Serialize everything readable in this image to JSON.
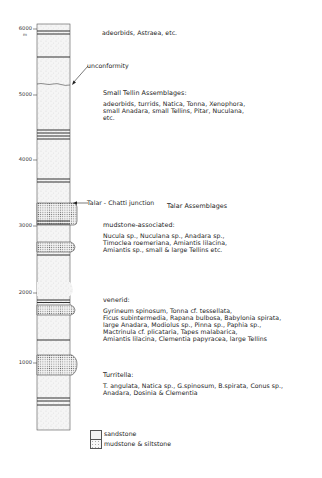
{
  "axis": {
    "ticks": [
      {
        "label": "6000",
        "y": 29
      },
      {
        "label": "5000",
        "y": 95
      },
      {
        "label": "4000",
        "y": 160
      },
      {
        "label": "3000",
        "y": 226
      },
      {
        "label": "2000",
        "y": 293
      },
      {
        "label": "1000",
        "y": 363
      }
    ],
    "unit": "m"
  },
  "annotations": {
    "unconformity": "unconformity",
    "junction": "Talar - Chatti junction"
  },
  "assemblages": {
    "top": {
      "header": "",
      "lines": [
        "adeorbids, Astraea, etc."
      ]
    },
    "small_tellin": {
      "header": "Small Tellin Assemblages:",
      "lines": [
        "adeorbids, turrids, Natica, Tonna, Xenophora,",
        "small Anadara, small Tellins, Pitar, Nuculana,",
        "etc."
      ]
    },
    "talar_title": "Talar Assemblages",
    "mudstone": {
      "header": "mudstone-associated:",
      "lines": [
        "Nucula sp., Nuculana sp., Anadara sp.,",
        "Timoclea roemeriana, Amiantis lilacina,",
        "Amiantis sp., small & large Tellins etc."
      ]
    },
    "venerid": {
      "header": "venerid:",
      "lines": [
        "Gyrineum spinosum, Tonna cf. tessellata,",
        "Ficus subintermedia, Rapana bulbosa, Babylonia spirata,",
        "large Anadara, Modiolus sp., Pinna sp., Paphia sp.,",
        "Mactrinula cf. plicataria, Tapes malabarica,",
        "Amiantis lilacina, Clementia papyracea, large Tellins"
      ]
    },
    "turritella": {
      "header": "Turritella:",
      "lines": [
        "T. angulata, Natica sp., G.spinosum, B.spirata, Conus sp.,",
        "Anadara, Dosinia & Clementia"
      ]
    }
  },
  "legend": {
    "items": [
      {
        "label": "sandstone",
        "pattern": "sand"
      },
      {
        "label": "mudstone & siltstone",
        "pattern": "mud"
      }
    ]
  },
  "colors": {
    "ink": "#222222",
    "paper": "#ffffff",
    "fill": "#f3f3f3"
  }
}
